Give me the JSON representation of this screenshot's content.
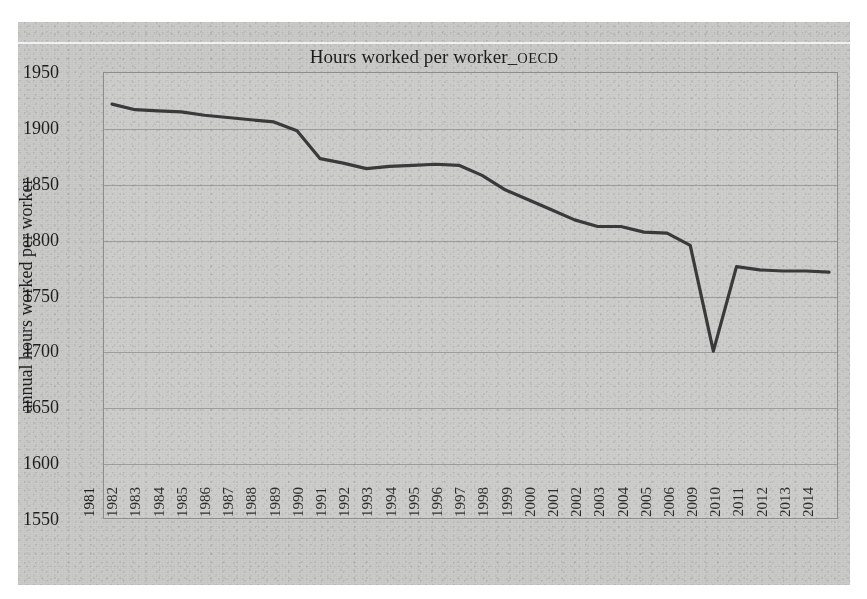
{
  "figure": {
    "title_main": "Hours worked per worker_",
    "title_suffix": "OECD",
    "background_color": "#c9c9c7",
    "line_color": "#3a3a3a"
  },
  "chart_data": {
    "type": "line",
    "title": "Hours worked per worker_OECD",
    "xlabel": "",
    "ylabel": "annual hours worked per worker",
    "ylim": [
      1550,
      1950
    ],
    "yticks": [
      1550,
      1600,
      1650,
      1700,
      1750,
      1800,
      1850,
      1900,
      1950
    ],
    "grid": true,
    "legend": "none",
    "categories": [
      "1981",
      "1982",
      "1983",
      "1984",
      "1985",
      "1986",
      "1987",
      "1988",
      "1989",
      "1990",
      "1991",
      "1992",
      "1993",
      "1994",
      "1995",
      "1996",
      "1997",
      "1998",
      "1999",
      "2000",
      "2001",
      "2002",
      "2003",
      "2004",
      "2005",
      "2006",
      "2009",
      "2010",
      "2011",
      "2012",
      "2013",
      "2014"
    ],
    "values": [
      1922,
      1917,
      1916,
      1915,
      1912,
      1910,
      1908,
      1906,
      1898,
      1873,
      1869,
      1864,
      1866,
      1867,
      1868,
      1867,
      1858,
      1845,
      1836,
      1827,
      1818,
      1812,
      1812,
      1807,
      1806,
      1795,
      1700,
      1776,
      1773,
      1772,
      1772,
      1771
    ],
    "series_name": "annual hours worked per worker"
  }
}
